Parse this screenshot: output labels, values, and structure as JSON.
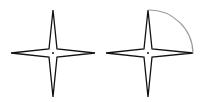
{
  "diagram": {
    "title": "",
    "figures": [
      {
        "name": "four-point-star",
        "center": [
          53,
          53
        ],
        "outer_radius": 43,
        "inner_offset": 5,
        "arc": false
      },
      {
        "name": "four-point-star-with-arc",
        "center": [
          148,
          53
        ],
        "outer_radius": 43,
        "inner_offset": 5,
        "arc": true
      }
    ],
    "colors": {
      "stroke": "#111111",
      "arc": "#999999",
      "background": "#ffffff"
    }
  }
}
